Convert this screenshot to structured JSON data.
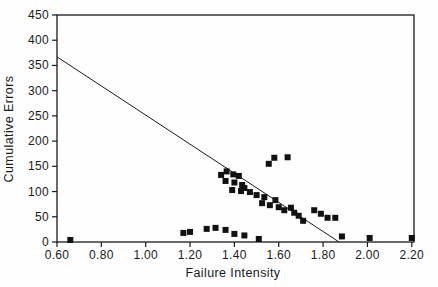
{
  "figure": {
    "background": "#fefefe",
    "ink": "#1a1a1a",
    "marker_color": "#111111"
  },
  "chart_data": {
    "type": "scatter",
    "title": "",
    "xlabel": "Failure Intensity",
    "ylabel": "Cumulative Errors",
    "xlim": [
      0.6,
      2.21
    ],
    "ylim": [
      0,
      450
    ],
    "grid": false,
    "legend": "none",
    "marker": "filled-square",
    "marker_size": 6,
    "xticks": [
      {
        "v": 0.6,
        "label": "0.60"
      },
      {
        "v": 0.8,
        "label": "0.80"
      },
      {
        "v": 1.0,
        "label": "1.00"
      },
      {
        "v": 1.2,
        "label": "1.20"
      },
      {
        "v": 1.4,
        "label": "1.40"
      },
      {
        "v": 1.6,
        "label": "1.60"
      },
      {
        "v": 1.8,
        "label": "1.80"
      },
      {
        "v": 2.0,
        "label": "2.00"
      },
      {
        "v": 2.2,
        "label": "2.20"
      }
    ],
    "yticks": [
      {
        "v": 0,
        "label": "0"
      },
      {
        "v": 50,
        "label": "50"
      },
      {
        "v": 100,
        "label": "100"
      },
      {
        "v": 150,
        "label": "150"
      },
      {
        "v": 200,
        "label": "200"
      },
      {
        "v": 250,
        "label": "250"
      },
      {
        "v": 300,
        "label": "300"
      },
      {
        "v": 350,
        "label": "350"
      },
      {
        "v": 400,
        "label": "400"
      },
      {
        "v": 450,
        "label": "450"
      }
    ],
    "trend_line": {
      "x1": 0.6,
      "y1": 367,
      "x2": 1.872,
      "y2": 0
    },
    "points": [
      [
        0.66,
        4
      ],
      [
        1.17,
        18
      ],
      [
        1.2,
        20
      ],
      [
        1.275,
        26
      ],
      [
        1.315,
        28
      ],
      [
        1.36,
        24
      ],
      [
        1.4,
        16
      ],
      [
        1.445,
        13
      ],
      [
        1.51,
        6
      ],
      [
        1.885,
        11
      ],
      [
        2.01,
        8
      ],
      [
        2.2,
        8
      ],
      [
        1.34,
        133
      ],
      [
        1.365,
        140
      ],
      [
        1.395,
        134
      ],
      [
        1.42,
        131
      ],
      [
        1.36,
        121
      ],
      [
        1.4,
        118
      ],
      [
        1.435,
        113
      ],
      [
        1.39,
        103
      ],
      [
        1.445,
        107
      ],
      [
        1.43,
        101
      ],
      [
        1.47,
        99
      ],
      [
        1.5,
        93
      ],
      [
        1.535,
        89
      ],
      [
        1.525,
        77
      ],
      [
        1.585,
        83
      ],
      [
        1.56,
        73
      ],
      [
        1.6,
        69
      ],
      [
        1.625,
        63
      ],
      [
        1.655,
        68
      ],
      [
        1.67,
        58
      ],
      [
        1.69,
        52
      ],
      [
        1.71,
        42
      ],
      [
        1.76,
        63
      ],
      [
        1.79,
        56
      ],
      [
        1.82,
        48
      ],
      [
        1.855,
        48
      ],
      [
        1.555,
        155
      ],
      [
        1.58,
        167
      ],
      [
        1.64,
        168
      ]
    ],
    "layout": {
      "plot": {
        "x": 57,
        "y": 15,
        "w": 357,
        "h": 227
      },
      "x_tick_len": 5,
      "y_tick_len": 5,
      "x_label_offset": 17,
      "y_label_offset": 8,
      "xlabel_pos": {
        "x": 233,
        "y": 277
      },
      "ylabel_pos": {
        "x": 13,
        "y": 129
      }
    }
  }
}
